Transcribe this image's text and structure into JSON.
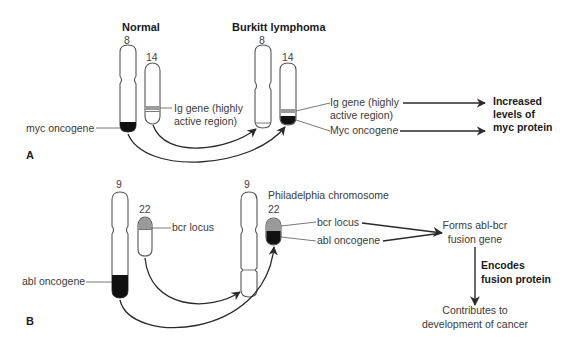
{
  "panel_a": {
    "letter": "A",
    "normal_title": "Normal",
    "burkitt_title": "Burkitt lymphoma",
    "normal_chr8_label": "8",
    "normal_chr14_label": "14",
    "burkitt_chr8_label": "8",
    "burkitt_chr14_label": "14",
    "ig_gene_line1": "Ig gene (highly",
    "ig_gene_line2": "active region)",
    "myc_oncogene_left": "myc oncogene",
    "bl_ig_gene_line1": "Ig gene (highly",
    "bl_ig_gene_line2": "active region)",
    "bl_myc_oncogene": "Myc oncogene",
    "result_line1": "Increased",
    "result_line2": "levels of",
    "result_line3": "myc protein"
  },
  "panel_b": {
    "letter": "B",
    "chr9_label": "9",
    "chr22_label": "22",
    "bcr_locus_left": "bcr locus",
    "abl_oncogene_left": "abl oncogene",
    "der_chr9_label": "9",
    "philadelphia_title": "Philadelphia chromosome",
    "ph_chr22_label": "22",
    "ph_bcr_locus": "bcr locus",
    "ph_abl_oncogene": "abl oncogene",
    "fusion_line1": "Forms abl-bcr",
    "fusion_line2": "fusion gene",
    "encodes_line1": "Encodes",
    "encodes_line2": "fusion protein",
    "outcome_line1": "Contributes to",
    "outcome_line2": "development of cancer"
  },
  "colors": {
    "outline": "#555555",
    "oncogene_fill": "#111111",
    "locus_fill": "#9a9a9a",
    "arrow": "#2a2a2a"
  }
}
